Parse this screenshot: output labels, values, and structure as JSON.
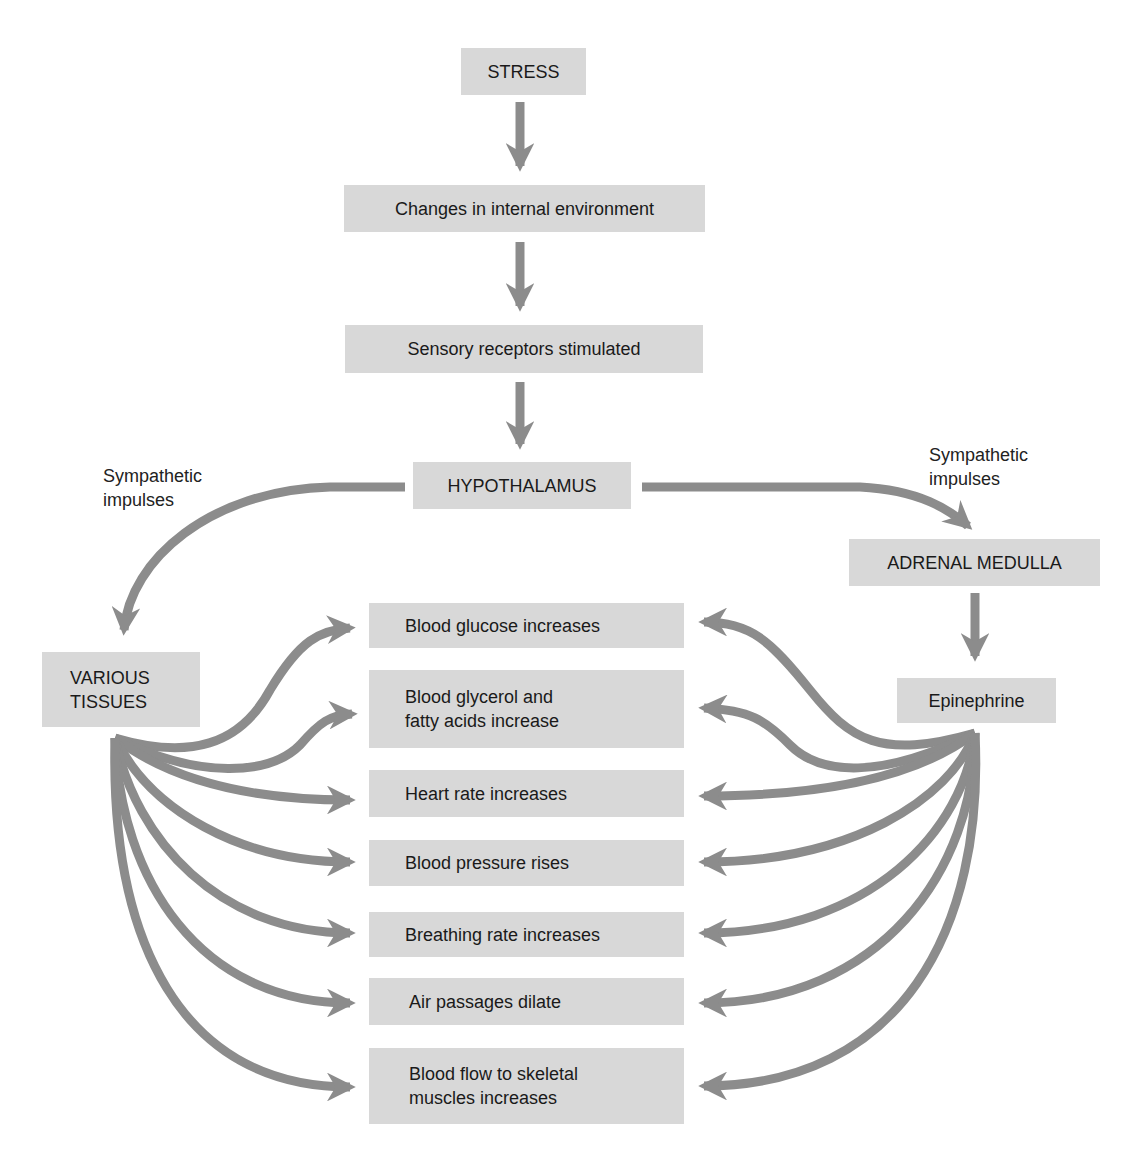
{
  "diagram": {
    "colors": {
      "box_fill": "#d8d8d8",
      "arrow": "#8c8c8c",
      "text": "#1a1a1a"
    },
    "chain": [
      {
        "id": "stress",
        "label": "STRESS"
      },
      {
        "id": "changes",
        "label": "Changes in internal environment"
      },
      {
        "id": "sensory",
        "label": "Sensory receptors stimulated"
      },
      {
        "id": "hypothalamus",
        "label": "HYPOTHALAMUS"
      }
    ],
    "left_branch": {
      "edge_label": "Sympathetic\nimpulses",
      "target": "VARIOUS\nTISSUES"
    },
    "right_branch": {
      "edge_label": "Sympathetic\nimpulses",
      "target": "ADRENAL MEDULLA",
      "product": "Epinephrine"
    },
    "effects": [
      "Blood glucose increases",
      "Blood glycerol and\nfatty acids increase",
      "Heart rate increases",
      "Blood pressure rises",
      "Breathing rate increases",
      "Air passages dilate",
      "Blood flow to skeletal\nmuscles increases"
    ],
    "edges": [
      [
        "STRESS",
        "Changes in internal environment"
      ],
      [
        "Changes in internal environment",
        "Sensory receptors stimulated"
      ],
      [
        "Sensory receptors stimulated",
        "HYPOTHALAMUS"
      ],
      [
        "HYPOTHALAMUS",
        "VARIOUS TISSUES"
      ],
      [
        "HYPOTHALAMUS",
        "ADRENAL MEDULLA"
      ],
      [
        "ADRENAL MEDULLA",
        "Epinephrine"
      ],
      [
        "VARIOUS TISSUES",
        "each effect"
      ],
      [
        "Epinephrine",
        "each effect"
      ]
    ]
  }
}
